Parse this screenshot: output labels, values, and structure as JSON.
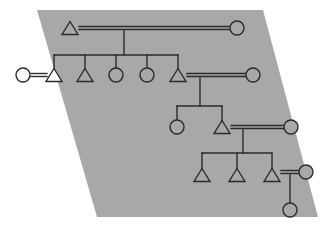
{
  "figure": {
    "width": 323,
    "height": 227
  },
  "colors": {
    "background": "#ffffff",
    "panel_fill": "#a8a8a8",
    "stroke": "#2b2b2b",
    "symbol_fill_open": "#a8a8a8",
    "symbol_fill_outside": "#ffffff"
  },
  "style": {
    "stroke_width": 1.4,
    "marriage_gap": 3.0,
    "symbol_radius": 7.0,
    "triangle_half_width": 8.0,
    "triangle_height": 13.0
  },
  "panel": {
    "shape": "parallelogram",
    "points": "37,10 263,10 318,217 97,217"
  },
  "symbols": {
    "male_glyph": "triangle",
    "female_glyph": "circle",
    "marriage_glyph": "double-horizontal-line",
    "descent_glyph": "vertical-line",
    "sibling_glyph": "horizontal-bar"
  },
  "legend": {
    "male": "Male (triangle)",
    "female": "Female (circle)",
    "marriage": "Marriage (double line)",
    "descent": "Descent (single line)"
  },
  "generations": [
    {
      "id": "gen-1",
      "label": "Generation 1",
      "y": 28,
      "nodes": [
        {
          "id": "g1-male-1",
          "type": "male",
          "x": 70,
          "y": 28,
          "role": "founder-husband"
        },
        {
          "id": "g1-female-1",
          "type": "female",
          "x": 237,
          "y": 28,
          "role": "founder-wife"
        }
      ],
      "marriages": [
        {
          "id": "m1",
          "left": "g1-male-1",
          "right": "g1-female-1",
          "x1": 79,
          "x2": 230,
          "y": 28
        }
      ],
      "descent": {
        "from": "m1",
        "x": 124,
        "y_top": 31,
        "y_bottom": 55
      }
    },
    {
      "id": "gen-2",
      "label": "Generation 2",
      "y": 75,
      "sibling_bar": {
        "x1": 54,
        "x2": 178,
        "y": 55
      },
      "nodes": [
        {
          "id": "g2-female-spouse",
          "type": "female",
          "x": 23,
          "y": 75,
          "role": "in-marrying-wife"
        },
        {
          "id": "g2-male-1",
          "type": "male",
          "x": 54,
          "y": 75,
          "role": "child-1"
        },
        {
          "id": "g2-male-2",
          "type": "male",
          "x": 85,
          "y": 75,
          "role": "child-2"
        },
        {
          "id": "g2-female-1",
          "type": "female",
          "x": 116,
          "y": 75,
          "role": "child-3"
        },
        {
          "id": "g2-female-2",
          "type": "female",
          "x": 147,
          "y": 75,
          "role": "child-4"
        },
        {
          "id": "g2-male-3",
          "type": "male",
          "x": 178,
          "y": 75,
          "role": "child-5"
        },
        {
          "id": "g2-female-spouse-2",
          "type": "female",
          "x": 253,
          "y": 75,
          "role": "in-marrying-wife-2"
        }
      ],
      "marriages": [
        {
          "id": "m2",
          "left": "g2-female-spouse",
          "right": "g2-male-1",
          "x1": 31,
          "x2": 47,
          "y": 75
        },
        {
          "id": "m3",
          "left": "g2-male-3",
          "right": "g2-female-spouse-2",
          "x1": 187,
          "x2": 246,
          "y": 75
        }
      ],
      "descent": {
        "from": "m3",
        "x": 200,
        "y_top": 78,
        "y_bottom": 106
      }
    },
    {
      "id": "gen-3",
      "label": "Generation 3",
      "y": 127,
      "sibling_bar": {
        "x1": 177,
        "x2": 222,
        "y": 106
      },
      "nodes": [
        {
          "id": "g3-female-1",
          "type": "female",
          "x": 177,
          "y": 127,
          "role": "child-1"
        },
        {
          "id": "g3-male-1",
          "type": "male",
          "x": 222,
          "y": 127,
          "role": "child-2"
        },
        {
          "id": "g3-female-spouse",
          "type": "female",
          "x": 291,
          "y": 127,
          "role": "in-marrying-wife"
        }
      ],
      "marriages": [
        {
          "id": "m4",
          "left": "g3-male-1",
          "right": "g3-female-spouse",
          "x1": 231,
          "x2": 284,
          "y": 127
        }
      ],
      "descent": {
        "from": "m4",
        "x": 243,
        "y_top": 130,
        "y_bottom": 153
      }
    },
    {
      "id": "gen-4",
      "label": "Generation 4",
      "y": 175,
      "sibling_bar": {
        "x1": 202,
        "x2": 272,
        "y": 153
      },
      "nodes": [
        {
          "id": "g4-male-1",
          "type": "male",
          "x": 202,
          "y": 175,
          "role": "child-1"
        },
        {
          "id": "g4-male-2",
          "type": "male",
          "x": 237,
          "y": 175,
          "role": "child-2"
        },
        {
          "id": "g4-male-3",
          "type": "male",
          "x": 272,
          "y": 175,
          "role": "child-3"
        },
        {
          "id": "g4-female-spouse",
          "type": "female",
          "x": 306,
          "y": 172,
          "role": "in-marrying-wife"
        }
      ],
      "marriages": [
        {
          "id": "m5",
          "left": "g4-male-3",
          "right": "g4-female-spouse",
          "x1": 281,
          "x2": 299,
          "y": 172
        }
      ],
      "descent": {
        "from": "m5",
        "x": 290,
        "y_top": 175,
        "y_bottom": 203
      }
    },
    {
      "id": "gen-5",
      "label": "Generation 5",
      "y": 210,
      "nodes": [
        {
          "id": "g5-female-1",
          "type": "female",
          "x": 290,
          "y": 210,
          "role": "child-1"
        }
      ],
      "marriages": [],
      "descent": null
    }
  ]
}
